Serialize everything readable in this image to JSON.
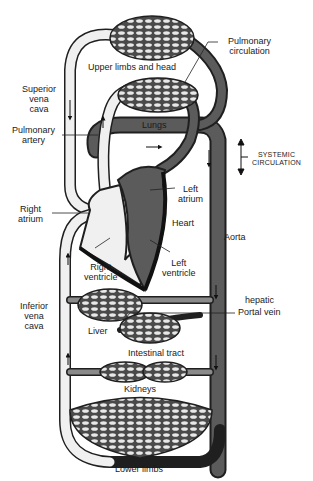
{
  "colors": {
    "oxygenated": "#5b5b5b",
    "deoxygenated": "#f0f0f0",
    "outline": "#1f1f1f",
    "capillary_bg": "#4a4a4a",
    "capillary_cell": "#e8e8e8",
    "background": "#ffffff"
  },
  "labels": {
    "upper_limbs": "Upper limbs and head",
    "pulmonary_circulation_1": "Pulmonary",
    "pulmonary_circulation_2": "circulation",
    "superior_vena_cava_1": "Superior",
    "superior_vena_cava_2": "vena",
    "superior_vena_cava_3": "cava",
    "lungs": "Lungs",
    "pulmonary_artery_1": "Pulmonary",
    "pulmonary_artery_2": "artery",
    "systemic_1": "SYSTEMIC",
    "systemic_2": "CIRCULATION",
    "left_atrium_1": "Left",
    "left_atrium_2": "atrium",
    "right_atrium_1": "Right",
    "right_atrium_2": "atrium",
    "heart": "Heart",
    "aorta": "Aorta",
    "right_ventricle_1": "Right",
    "right_ventricle_2": "ventricle",
    "left_ventricle_1": "Left",
    "left_ventricle_2": "ventricle",
    "inferior_vena_cava_1": "Inferior",
    "inferior_vena_cava_2": "vena",
    "inferior_vena_cava_3": "cava",
    "hepatic": "hepatic",
    "portal_vein": "Portal vein",
    "liver": "Liver",
    "intestinal_tract": "Intestinal tract",
    "kidneys": "Kidneys",
    "lower_limbs": "Lower limbs"
  }
}
